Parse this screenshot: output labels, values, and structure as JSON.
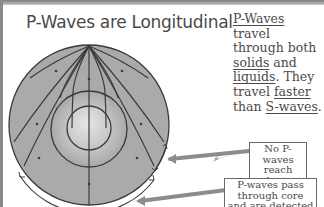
{
  "title": "P-Waves are Longitudinal",
  "description": {
    "parts": [
      {
        "text": "P-Waves",
        "underline": true
      },
      {
        "text": " travel through both ",
        "underline": false
      },
      {
        "text": "solids",
        "underline": true
      },
      {
        "text": " and ",
        "underline": false
      },
      {
        "text": "liquids",
        "underline": true
      },
      {
        "text": ". They travel ",
        "underline": false
      },
      {
        "text": "faster",
        "underline": true
      },
      {
        "text": " than ",
        "underline": false
      },
      {
        "text": "S-waves",
        "underline": true
      },
      {
        "text": ".",
        "underline": false
      }
    ]
  },
  "labels": {
    "shadow_zone": "No P-waves reach here",
    "detected": "P-waves pass through core and are detected here"
  },
  "diagram": {
    "layers": [
      "mantle",
      "outer core",
      "inner core"
    ],
    "colors": {
      "mantle": "#a8a8a8",
      "outer_core": "#b9b9b9",
      "inner_core": "#d6d6d6",
      "lines": "#3a3a3a",
      "arrows": "#6c6c6c"
    }
  }
}
